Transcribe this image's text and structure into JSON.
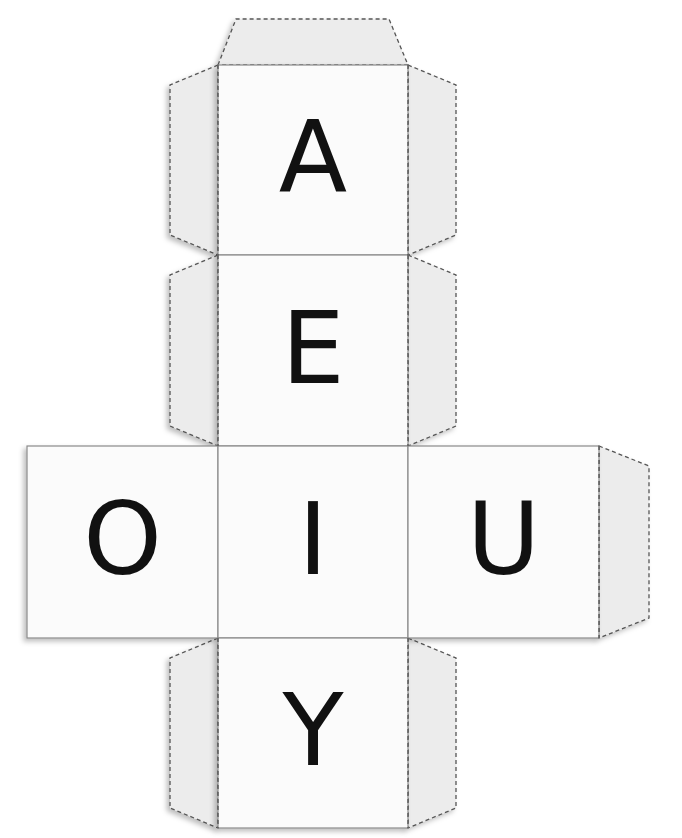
{
  "colors": {
    "page": "#ffffff",
    "face": "#fbfbfb",
    "flap": "#ececec",
    "fold_line": "#555555",
    "edge_line": "#8a8a8a",
    "letter": "#111111"
  },
  "faces": [
    {
      "id": "top",
      "letter": "A",
      "x": 218,
      "y": 65,
      "w": 190,
      "h": 190
    },
    {
      "id": "upper",
      "letter": "E",
      "x": 218,
      "y": 255,
      "w": 190,
      "h": 191
    },
    {
      "id": "left",
      "letter": "O",
      "x": 27,
      "y": 446,
      "w": 191,
      "h": 192
    },
    {
      "id": "center",
      "letter": "I",
      "x": 218,
      "y": 446,
      "w": 190,
      "h": 192
    },
    {
      "id": "right",
      "letter": "U",
      "x": 408,
      "y": 446,
      "w": 191,
      "h": 192
    },
    {
      "id": "bottom",
      "letter": "Y",
      "x": 218,
      "y": 638,
      "w": 190,
      "h": 190
    }
  ],
  "flaps": [
    {
      "id": "flap-top",
      "points": "218,65 236,19 389,19 408,65"
    },
    {
      "id": "flap-a-left",
      "points": "218,65 170,85 170,235 218,255"
    },
    {
      "id": "flap-a-right",
      "points": "408,65 456,85 456,235 408,255"
    },
    {
      "id": "flap-e-left",
      "points": "218,255 170,275 170,426 218,446"
    },
    {
      "id": "flap-e-right",
      "points": "408,255 456,275 456,426 408,446"
    },
    {
      "id": "flap-u-right",
      "points": "599,446 649,466 649,618 599,638"
    },
    {
      "id": "flap-y-left",
      "points": "218,638 170,658 170,808 218,828"
    },
    {
      "id": "flap-y-right",
      "points": "408,638 456,658 456,808 408,828"
    }
  ]
}
